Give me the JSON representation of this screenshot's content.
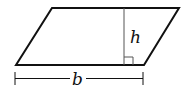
{
  "diagram": {
    "shape": "parallelogram",
    "labels": {
      "height": "h",
      "base": "b"
    },
    "colors": {
      "stroke": "#111111",
      "height_line": "#555555",
      "background": "#ffffff"
    }
  }
}
